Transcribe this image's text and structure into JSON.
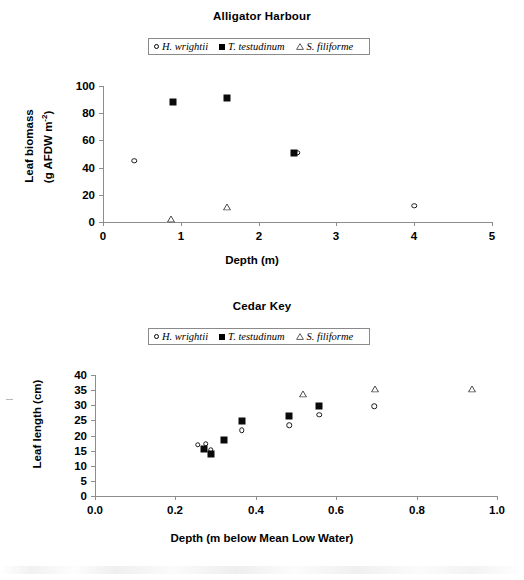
{
  "legend": {
    "entries": [
      {
        "marker": "open-circle",
        "label": "H. wrightii"
      },
      {
        "marker": "filled-square",
        "label": "T. testudinum"
      },
      {
        "marker": "open-triangle",
        "label": "S. filiforme"
      }
    ]
  },
  "chart_data": [
    {
      "type": "scatter",
      "title": "Alligator Harbour",
      "xlabel": "Depth (m)",
      "ylabel_line1": "Leaf biomass",
      "ylabel_line2": "(g AFDW m",
      "ylabel_exp": "-2",
      "ylabel_line2_end": ")",
      "xlim": [
        0,
        5
      ],
      "ylim": [
        0,
        100
      ],
      "xticks": [
        "0",
        "1",
        "2",
        "3",
        "4",
        "5"
      ],
      "xtick_values": [
        0,
        1,
        2,
        3,
        4,
        5
      ],
      "yticks": [
        "0",
        "20",
        "40",
        "60",
        "80",
        "100"
      ],
      "ytick_values": [
        0,
        20,
        40,
        60,
        80,
        100
      ],
      "grid": false,
      "legend_position": "top-center",
      "series": [
        {
          "name": "H. wrightii",
          "marker": "open-circle",
          "points": [
            [
              0.4,
              45
            ],
            [
              2.5,
              51
            ],
            [
              4.0,
              12
            ]
          ]
        },
        {
          "name": "T. testudinum",
          "marker": "filled-square",
          "points": [
            [
              0.9,
              88
            ],
            [
              1.6,
              91
            ],
            [
              2.45,
              51
            ]
          ]
        },
        {
          "name": "S. filiforme",
          "marker": "open-triangle",
          "points": [
            [
              0.88,
              2
            ],
            [
              1.6,
              11
            ]
          ]
        }
      ]
    },
    {
      "type": "scatter",
      "title": "Cedar Key",
      "xlabel": "Depth (m below Mean Low Water)",
      "ylabel": "Leaf length (cm)",
      "xlim": [
        0.0,
        1.0
      ],
      "ylim": [
        0,
        40
      ],
      "xticks": [
        "0.0",
        "0.2",
        "0.4",
        "0.6",
        "0.8",
        "1.0"
      ],
      "xtick_values": [
        0.0,
        0.2,
        0.4,
        0.6,
        0.8,
        1.0
      ],
      "yticks": [
        "0",
        "5",
        "10",
        "15",
        "20",
        "25",
        "30",
        "35",
        "40"
      ],
      "ytick_values": [
        0,
        5,
        10,
        15,
        20,
        25,
        30,
        35,
        40
      ],
      "grid": false,
      "legend_position": "top-center",
      "series": [
        {
          "name": "H. wrightii",
          "marker": "open-circle",
          "points": [
            [
              0.255,
              17.0
            ],
            [
              0.275,
              17.2
            ],
            [
              0.288,
              15.3
            ],
            [
              0.365,
              21.7
            ],
            [
              0.483,
              23.4
            ],
            [
              0.558,
              26.8
            ],
            [
              0.695,
              29.6
            ]
          ]
        },
        {
          "name": "T. testudinum",
          "marker": "filled-square",
          "points": [
            [
              0.272,
              15.4
            ],
            [
              0.288,
              14.0
            ],
            [
              0.32,
              18.6
            ],
            [
              0.365,
              24.8
            ],
            [
              0.483,
              26.4
            ],
            [
              0.558,
              29.6
            ]
          ]
        },
        {
          "name": "S. filiforme",
          "marker": "open-triangle",
          "points": [
            [
              0.518,
              33.7
            ],
            [
              0.697,
              35.3
            ],
            [
              0.938,
              35.4
            ]
          ]
        }
      ]
    }
  ]
}
